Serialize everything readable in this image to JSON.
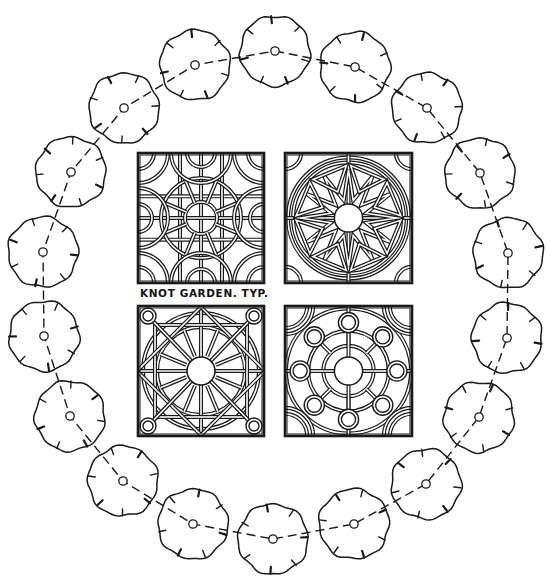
{
  "drawing": {
    "title_label": "KNOT GARDEN. TYP.",
    "label_position": {
      "x": 140,
      "y": 287
    },
    "ink_color": "#1a1a1a",
    "background": "#ffffff"
  },
  "tree_ring": {
    "count": 18,
    "tree_radius": 35,
    "path_style": "dashed",
    "trees": [
      {
        "x": 275,
        "y": 51
      },
      {
        "x": 355,
        "y": 67
      },
      {
        "x": 427,
        "y": 108
      },
      {
        "x": 480,
        "y": 173
      },
      {
        "x": 508,
        "y": 253
      },
      {
        "x": 507,
        "y": 338
      },
      {
        "x": 479,
        "y": 417
      },
      {
        "x": 426,
        "y": 484
      },
      {
        "x": 354,
        "y": 524
      },
      {
        "x": 273,
        "y": 539
      },
      {
        "x": 193,
        "y": 524
      },
      {
        "x": 123,
        "y": 481
      },
      {
        "x": 70,
        "y": 416
      },
      {
        "x": 44,
        "y": 336
      },
      {
        "x": 43,
        "y": 252
      },
      {
        "x": 71,
        "y": 172
      },
      {
        "x": 124,
        "y": 108
      },
      {
        "x": 195,
        "y": 65
      }
    ]
  },
  "knot_panels": [
    {
      "name": "grid-arcs",
      "x": 138,
      "y": 153,
      "w": 126,
      "h": 130
    },
    {
      "name": "star-burst",
      "x": 285,
      "y": 153,
      "w": 127,
      "h": 130
    },
    {
      "name": "star-circle",
      "x": 138,
      "y": 306,
      "w": 126,
      "h": 130
    },
    {
      "name": "ring-of-circles",
      "x": 285,
      "y": 306,
      "w": 127,
      "h": 130
    }
  ]
}
